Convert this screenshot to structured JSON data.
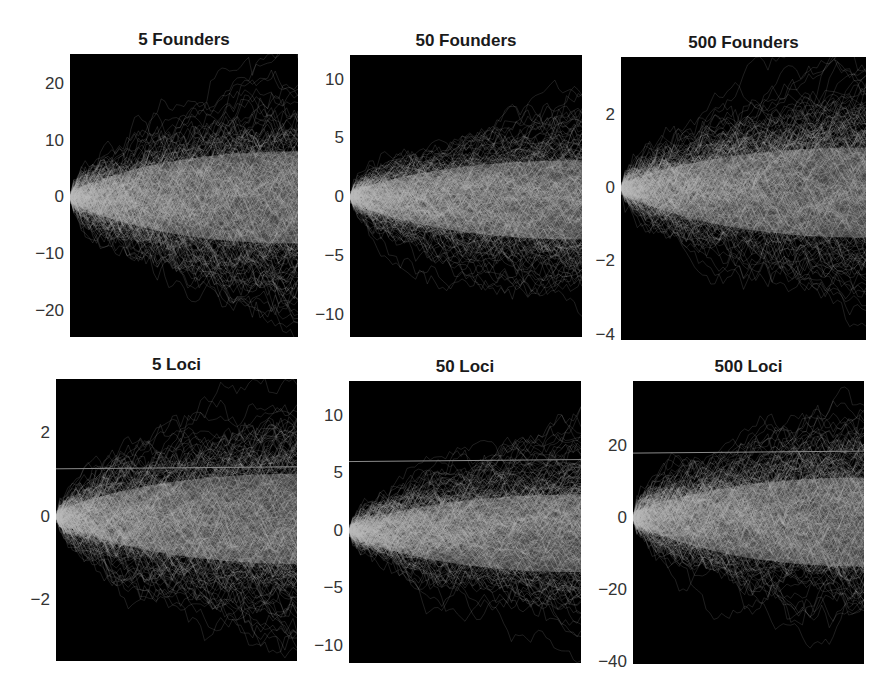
{
  "chart_data": [
    {
      "type": "line",
      "title": "5 Founders",
      "xlabel": "",
      "ylabel": "",
      "yticks": [
        20,
        10,
        0,
        -10,
        -20
      ],
      "ylim": [
        -24.5,
        25.2
      ],
      "spread_end": [
        -18,
        18
      ],
      "reference_line": null,
      "box": {
        "left": 70,
        "top": 54,
        "right": 298,
        "bottom": 337
      }
    },
    {
      "type": "line",
      "title": "50 Founders",
      "xlabel": "",
      "ylabel": "",
      "yticks": [
        10,
        5,
        0,
        -5,
        -10
      ],
      "ylim": [
        -11.9,
        12.1
      ],
      "spread_end": [
        -8,
        7
      ],
      "reference_line": null,
      "box": {
        "left": 350,
        "top": 55,
        "right": 582,
        "bottom": 337
      }
    },
    {
      "type": "line",
      "title": "500 Founders",
      "xlabel": "",
      "ylabel": "",
      "yticks": [
        2,
        0,
        -2,
        -4
      ],
      "ylim": [
        -4.15,
        3.6
      ],
      "spread_end": [
        -3,
        2.5
      ],
      "reference_line": null,
      "box": {
        "left": 621,
        "top": 57,
        "right": 866,
        "bottom": 340
      }
    },
    {
      "type": "line",
      "title": "5 Loci",
      "xlabel": "",
      "ylabel": "",
      "yticks": [
        2,
        0,
        -2
      ],
      "ylim": [
        -3.45,
        3.3
      ],
      "spread_end": [
        -2.5,
        2.3
      ],
      "reference_line": 1.15,
      "box": {
        "left": 56,
        "top": 379,
        "right": 297,
        "bottom": 661
      }
    },
    {
      "type": "line",
      "title": "50 Loci",
      "xlabel": "",
      "ylabel": "",
      "yticks": [
        10,
        5,
        0,
        -5,
        -10
      ],
      "ylim": [
        -11.5,
        13.0
      ],
      "spread_end": [
        -8,
        7
      ],
      "reference_line": 6,
      "box": {
        "left": 349,
        "top": 381,
        "right": 581,
        "bottom": 663
      }
    },
    {
      "type": "line",
      "title": "500 Loci",
      "xlabel": "",
      "ylabel": "",
      "yticks": [
        20,
        0,
        -20,
        -40
      ],
      "ylim": [
        -40.5,
        38.0
      ],
      "spread_end": [
        -30,
        25
      ],
      "reference_line": 18,
      "box": {
        "left": 633,
        "top": 381,
        "right": 864,
        "bottom": 664
      }
    }
  ],
  "colors": {
    "background": "#000000",
    "trajectory": "#bdbdbd",
    "reference_line": "#8a8a8a",
    "page": "#ffffff",
    "text": "#1a1a1a"
  }
}
